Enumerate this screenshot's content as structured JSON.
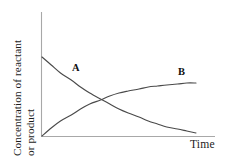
{
  "chart_data": {
    "type": "line",
    "title": "",
    "subtitle": "",
    "xlabel": "Time",
    "ylabel": "Concentration of reactant or product",
    "ylabel_lines": [
      "Concentration of reactant",
      "or product"
    ],
    "xlim": [
      0,
      1
    ],
    "ylim": [
      0,
      1
    ],
    "grid": false,
    "legend_position": "inline-annotations",
    "tick_labels": {
      "x": [],
      "y": []
    },
    "annotations": [
      {
        "text": "A",
        "series": "A",
        "x": 0.21,
        "y": 0.63
      },
      {
        "text": "B",
        "series": "B",
        "x": 0.89,
        "y": 0.6
      }
    ],
    "series": [
      {
        "name": "A",
        "label": "A",
        "description": "Concentration of reactant A decaying exponentially from initial maximum toward zero",
        "color": "#4a4a4a",
        "x": [
          0.0,
          0.06,
          0.12,
          0.19,
          0.25,
          0.31,
          0.38,
          0.44,
          0.5,
          0.56,
          0.63,
          0.69,
          0.75,
          0.81,
          0.88,
          0.94,
          1.0
        ],
        "y": [
          0.79,
          0.71,
          0.63,
          0.56,
          0.49,
          0.43,
          0.37,
          0.32,
          0.27,
          0.23,
          0.19,
          0.15,
          0.12,
          0.09,
          0.07,
          0.05,
          0.03
        ]
      },
      {
        "name": "B",
        "label": "B",
        "description": "Concentration of product B rising from zero and leveling off at a plateau",
        "color": "#4a4a4a",
        "x": [
          0.0,
          0.06,
          0.12,
          0.19,
          0.25,
          0.31,
          0.38,
          0.44,
          0.5,
          0.56,
          0.63,
          0.69,
          0.75,
          0.81,
          0.88,
          0.94,
          1.0
        ],
        "y": [
          0.0,
          0.08,
          0.15,
          0.21,
          0.27,
          0.32,
          0.36,
          0.4,
          0.43,
          0.45,
          0.47,
          0.49,
          0.5,
          0.51,
          0.52,
          0.53,
          0.53
        ]
      }
    ]
  },
  "axes": {
    "x_axis_name": "time-axis",
    "y_axis_name": "concentration-axis",
    "axis_color": "#a8a8a8"
  }
}
